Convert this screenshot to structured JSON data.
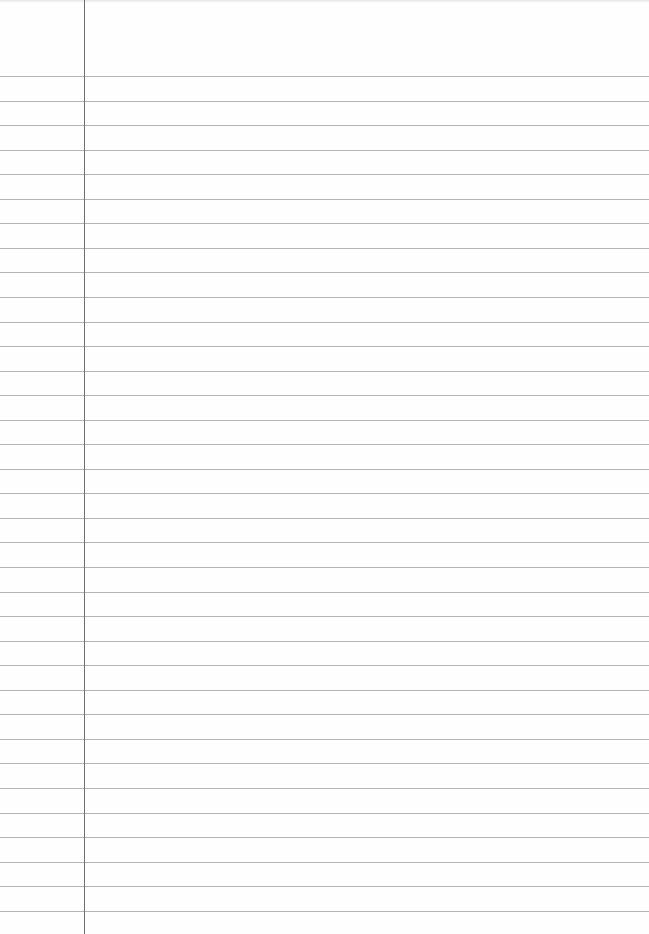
{
  "paper": {
    "type": "lined-notebook-page",
    "background_color": "#fefefe",
    "rule_color": "#b4b4b4",
    "margin_color": "#6e6e6e",
    "margin_x": 84,
    "first_rule_y": 76,
    "rule_spacing": 24.55,
    "rule_count": 35
  }
}
